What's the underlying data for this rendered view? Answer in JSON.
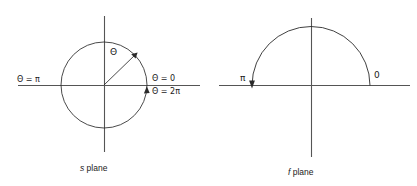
{
  "figure": {
    "type": "diagram",
    "background_color": "#ffffff",
    "stroke_color": "#4d4d4d",
    "curve_color": "#2b2b2b",
    "text_color": "#1a1a1a",
    "panels": [
      {
        "id": "s-plane",
        "caption_italic": "s",
        "caption_rest": " plane",
        "shape": "full-circle",
        "center": [
          104,
          85
        ],
        "radius": 43,
        "labels": {
          "left_axis": "Θ = π",
          "right_axis_above": "Θ = 0",
          "right_axis_below": "Θ = 2π",
          "radius_angle": "Θ"
        },
        "arrows": [
          {
            "name": "radius-arrow",
            "direction": "up-right-45deg"
          },
          {
            "name": "circle-direction-arrow",
            "direction": "counterclockwise-up"
          }
        ]
      },
      {
        "id": "f-plane",
        "caption_italic": "f",
        "caption_rest": " plane",
        "shape": "upper-semicircle",
        "center": [
          311,
          86
        ],
        "radius": 59,
        "labels": {
          "left_end": "π",
          "right_end": "0"
        },
        "arrows": [
          {
            "name": "semicircle-direction-arrow",
            "direction": "down-at-left-end"
          }
        ]
      }
    ]
  },
  "captions": {
    "s_plane_italic": "s",
    "s_plane_text": " plane",
    "f_plane_italic": "f",
    "f_plane_text": " plane"
  },
  "labels": {
    "theta_pi": "Θ = π",
    "theta_zero": "Θ = 0",
    "theta_2pi": "Θ = 2π",
    "theta": "Θ",
    "pi": "π",
    "zero": "0"
  }
}
